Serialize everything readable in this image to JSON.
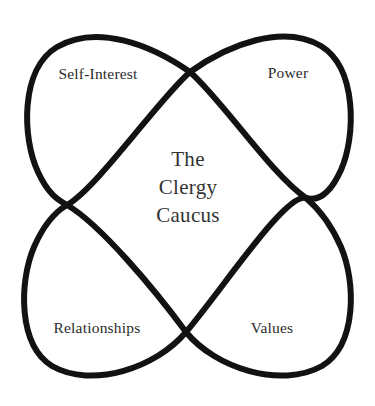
{
  "diagram": {
    "type": "four-petal-overlapping-loops",
    "title_lines": [
      "The",
      "Clergy",
      "Caucus"
    ],
    "center_title_full": "The Clergy Caucus",
    "stroke_color": "#121212",
    "background_color": "#ffffff",
    "text_color": "#2b2b2b",
    "center_text_color": "#333333",
    "stroke_width": 6,
    "quadrant_labels": [
      {
        "id": "self-interest",
        "label": "Self-Interest",
        "position": "top-left",
        "x": 98,
        "y": 74
      },
      {
        "id": "power",
        "label": "Power",
        "position": "top-right",
        "x": 288,
        "y": 73
      },
      {
        "id": "relationships",
        "label": "Relationships",
        "position": "bottom-left",
        "x": 97,
        "y": 328
      },
      {
        "id": "values",
        "label": "Values",
        "position": "bottom-right",
        "x": 272,
        "y": 328
      }
    ],
    "crossing_points": [
      {
        "id": "top",
        "x": 190,
        "y": 72
      },
      {
        "id": "left",
        "x": 67,
        "y": 205
      },
      {
        "id": "right",
        "x": 306,
        "y": 198
      },
      {
        "id": "bottom",
        "x": 186,
        "y": 332
      }
    ]
  }
}
